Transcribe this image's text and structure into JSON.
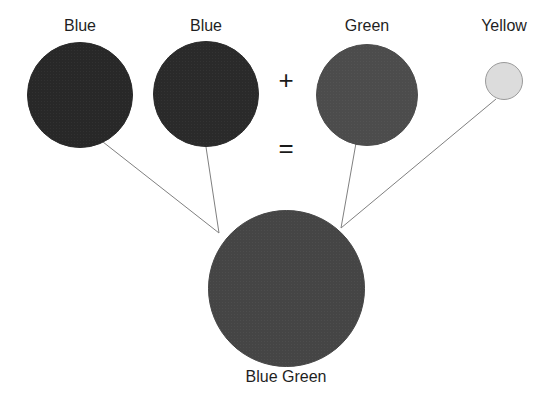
{
  "figure": {
    "background_color": "#ffffff",
    "line_color": "#808080",
    "text_color": "#1f1f1f"
  },
  "operators": {
    "plus": "+",
    "equals": "="
  },
  "sources": [
    {
      "id": "blue-1",
      "label": "Blue",
      "color": "#282828",
      "border_color": "#282828",
      "cx": 80,
      "cy": 95,
      "d": 106,
      "label_x": 80,
      "label_y": 17
    },
    {
      "id": "blue-2",
      "label": "Blue",
      "color": "#2a2a2a",
      "border_color": "#2a2a2a",
      "cx": 206,
      "cy": 94,
      "d": 106,
      "label_x": 206,
      "label_y": 17
    },
    {
      "id": "green",
      "label": "Green",
      "color": "#4c4c4c",
      "border_color": "#4c4c4c",
      "cx": 367,
      "cy": 95,
      "d": 102,
      "label_x": 367,
      "label_y": 17
    },
    {
      "id": "yellow",
      "label": "Yellow",
      "color": "#dcdcdc",
      "border_color": "#9a9a9a",
      "cx": 504,
      "cy": 81,
      "d": 38,
      "label_x": 504,
      "label_y": 17
    }
  ],
  "result": {
    "id": "blue-green",
    "label": "Blue Green",
    "color": "#454545",
    "border_color": "#454545",
    "cx": 286,
    "cy": 288,
    "d": 157,
    "label_x": 286,
    "label_y": 368
  },
  "connectors": [
    {
      "from": "blue-1",
      "x1": 103,
      "y1": 142,
      "x2": 219,
      "y2": 233
    },
    {
      "from": "blue-2",
      "x1": 206,
      "y1": 147,
      "x2": 219,
      "y2": 233
    },
    {
      "from": "green",
      "x1": 356,
      "y1": 143,
      "x2": 341,
      "y2": 228
    },
    {
      "from": "yellow",
      "x1": 496,
      "y1": 99,
      "x2": 341,
      "y2": 228
    }
  ]
}
